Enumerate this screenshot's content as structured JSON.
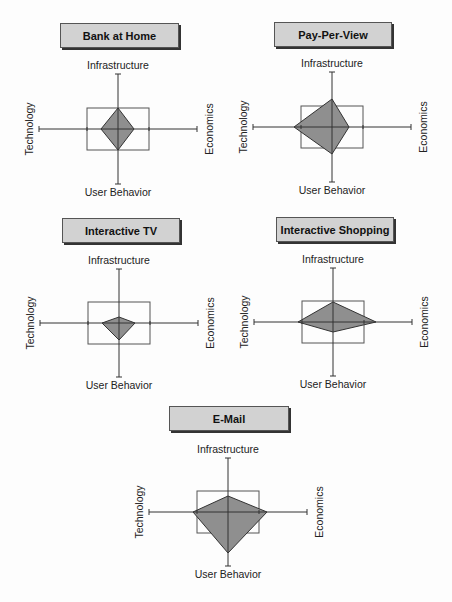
{
  "axes": {
    "top": "Infrastructure",
    "right": "Economics",
    "bottom": "User Behavior",
    "left": "Technology"
  },
  "colors": {
    "fill": "#8f8f8f",
    "line": "#333333",
    "title_bg": "#d2d2d2"
  },
  "chart_data": [
    {
      "type": "radar",
      "title": "Bank at Home",
      "axes": [
        "Infrastructure",
        "Economics",
        "User Behavior",
        "Technology"
      ],
      "values": [
        0.38,
        0.2,
        0.38,
        0.22
      ],
      "reference_box": {
        "half_width": 0.39,
        "half_height": 0.38
      },
      "layout": {
        "cx": 118,
        "cy": 129,
        "ax_h": 79,
        "ax_v": 55,
        "box_w": 31,
        "box_h": 21,
        "poly": [
          21,
          16,
          21,
          17
        ],
        "title_x": 60,
        "title_y": 23,
        "title_w": 117
      }
    },
    {
      "type": "radar",
      "title": "Pay-Per-View",
      "axes": [
        "Infrastructure",
        "Economics",
        "User Behavior",
        "Technology"
      ],
      "values": [
        0.51,
        0.22,
        0.49,
        0.48
      ],
      "reference_box": {
        "half_width": 0.39,
        "half_height": 0.38
      },
      "layout": {
        "cx": 332,
        "cy": 127,
        "ax_h": 79,
        "ax_v": 55,
        "box_w": 31,
        "box_h": 21,
        "poly": [
          28,
          17,
          27,
          38
        ],
        "title_x": 274,
        "title_y": 22,
        "title_w": 116
      }
    },
    {
      "type": "radar",
      "title": "Interactive TV",
      "axes": [
        "Infrastructure",
        "Economics",
        "User Behavior",
        "Technology"
      ],
      "values": [
        0.11,
        0.2,
        0.31,
        0.22
      ],
      "reference_box": {
        "half_width": 0.39,
        "half_height": 0.38
      },
      "layout": {
        "cx": 119,
        "cy": 323,
        "ax_h": 79,
        "ax_v": 54,
        "box_w": 31,
        "box_h": 21,
        "poly": [
          6,
          16,
          17,
          17
        ],
        "title_x": 62,
        "title_y": 218,
        "title_w": 116
      }
    },
    {
      "type": "radar",
      "title": "Interactive Shopping",
      "axes": [
        "Infrastructure",
        "Economics",
        "User Behavior",
        "Technology"
      ],
      "values": [
        0.36,
        0.54,
        0.18,
        0.44
      ],
      "reference_box": {
        "half_width": 0.39,
        "half_height": 0.38
      },
      "layout": {
        "cx": 333,
        "cy": 322,
        "ax_h": 79,
        "ax_v": 54,
        "box_w": 31,
        "box_h": 21,
        "poly": [
          20,
          43,
          10,
          35
        ],
        "title_x": 276,
        "title_y": 217,
        "title_w": 116
      }
    },
    {
      "type": "radar",
      "title": "E-Mail",
      "axes": [
        "Infrastructure",
        "Economics",
        "User Behavior",
        "Technology"
      ],
      "values": [
        0.29,
        0.49,
        0.75,
        0.44
      ],
      "reference_box": {
        "half_width": 0.39,
        "half_height": 0.38
      },
      "layout": {
        "cx": 228,
        "cy": 512,
        "ax_h": 79,
        "ax_v": 54,
        "box_w": 31,
        "box_h": 21,
        "poly": [
          16,
          39,
          41,
          35
        ],
        "title_x": 169,
        "title_y": 406,
        "title_w": 118
      }
    }
  ]
}
